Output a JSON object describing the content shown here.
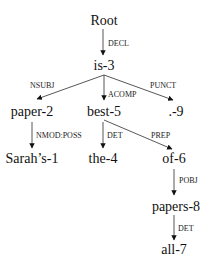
{
  "diagram": {
    "type": "dependency-parse-tree",
    "colors": {
      "node_text": "#111111",
      "edge": "#444444",
      "background": "#ffffff"
    },
    "nodes": [
      {
        "id": "root",
        "label": "Root",
        "x": 104,
        "y": 25
      },
      {
        "id": "is-3",
        "label": "is-3",
        "x": 104,
        "y": 70
      },
      {
        "id": "paper-2",
        "label": "paper-2",
        "x": 32,
        "y": 116
      },
      {
        "id": "best-5",
        "label": "best-5",
        "x": 104,
        "y": 116
      },
      {
        "id": "punct-9",
        "label": ".-9",
        "x": 176,
        "y": 116
      },
      {
        "id": "sarahs-1",
        "label": "Sarah’s-1",
        "x": 32,
        "y": 163
      },
      {
        "id": "the-4",
        "label": "the-4",
        "x": 103,
        "y": 163
      },
      {
        "id": "of-6",
        "label": "of-6",
        "x": 174,
        "y": 163
      },
      {
        "id": "papers-8",
        "label": "papers-8",
        "x": 176,
        "y": 211
      },
      {
        "id": "all-7",
        "label": "all-7",
        "x": 174,
        "y": 254
      }
    ],
    "edges": [
      {
        "from": "root",
        "to": "is-3",
        "label": "DECL",
        "x1": 103,
        "y1": 29,
        "x2": 103,
        "y2": 55,
        "lx": 108,
        "ly": 46,
        "anchor": "start"
      },
      {
        "from": "is-3",
        "to": "paper-2",
        "label": "NSUBJ",
        "x1": 104,
        "y1": 75,
        "x2": 37,
        "y2": 99,
        "lx": 30,
        "ly": 88,
        "anchor": "start"
      },
      {
        "from": "is-3",
        "to": "best-5",
        "label": "ACOMP",
        "x1": 104,
        "y1": 75,
        "x2": 104,
        "y2": 100,
        "lx": 108,
        "ly": 97,
        "anchor": "start"
      },
      {
        "from": "is-3",
        "to": "punct-9",
        "label": "PUNCT",
        "x1": 104,
        "y1": 75,
        "x2": 173,
        "y2": 100,
        "lx": 150,
        "ly": 88,
        "anchor": "start"
      },
      {
        "from": "paper-2",
        "to": "sarahs-1",
        "label": "NMOD:POSS",
        "x1": 32,
        "y1": 122,
        "x2": 32,
        "y2": 148,
        "lx": 36,
        "ly": 138,
        "anchor": "start"
      },
      {
        "from": "best-5",
        "to": "the-4",
        "label": "DET",
        "x1": 103,
        "y1": 122,
        "x2": 103,
        "y2": 148,
        "lx": 107,
        "ly": 138,
        "anchor": "start"
      },
      {
        "from": "best-5",
        "to": "of-6",
        "label": "PREP",
        "x1": 104,
        "y1": 120,
        "x2": 172,
        "y2": 149,
        "lx": 151,
        "ly": 138,
        "anchor": "start"
      },
      {
        "from": "of-6",
        "to": "papers-8",
        "label": "POBJ",
        "x1": 174,
        "y1": 169,
        "x2": 174,
        "y2": 195,
        "lx": 179,
        "ly": 183,
        "anchor": "start"
      },
      {
        "from": "papers-8",
        "to": "all-7",
        "label": "DET",
        "x1": 174,
        "y1": 215,
        "x2": 174,
        "y2": 240,
        "lx": 178,
        "ly": 231,
        "anchor": "start"
      }
    ]
  }
}
